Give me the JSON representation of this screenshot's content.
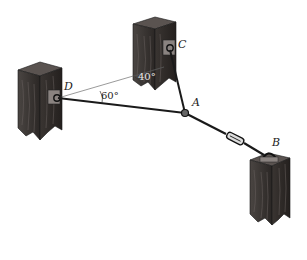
{
  "diagram": {
    "type": "statics-cable-system",
    "points": {
      "A": {
        "label": "A",
        "role": "cable junction ring"
      },
      "B": {
        "label": "B",
        "role": "anchor on post with turnbuckle cable"
      },
      "C": {
        "label": "C",
        "role": "anchor on post"
      },
      "D": {
        "label": "D",
        "role": "anchor on post"
      }
    },
    "cables": [
      {
        "from": "A",
        "to": "D"
      },
      {
        "from": "A",
        "to": "C"
      },
      {
        "from": "A",
        "to": "B",
        "feature": "turnbuckle"
      }
    ],
    "angles": [
      {
        "label": "60°",
        "between": "cable AD and reference line DC"
      },
      {
        "label": "40°",
        "between": "reference line DC and cable CA"
      }
    ],
    "posts": [
      "post-D",
      "post-C",
      "post-B"
    ],
    "colors": {
      "wood": "#2e2a28",
      "wood_light": "#5a5350",
      "cable": "#1a1a1a",
      "reference_line": "#555555"
    }
  }
}
